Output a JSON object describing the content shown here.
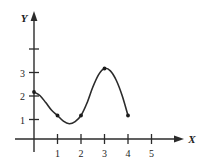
{
  "figure": {
    "background_color": "#ffffff",
    "ink_color": "#2b2b2b",
    "text_color": "#1c1c1c"
  },
  "axes": {
    "x_axis_label": "X",
    "y_axis_label": "Y",
    "x_tick_labels": [
      "1",
      "2",
      "3",
      "4",
      "5"
    ],
    "y_tick_labels": [
      "1",
      "2",
      "3"
    ]
  },
  "chart_data": {
    "type": "line",
    "title": "",
    "xlabel": "X",
    "ylabel": "Y",
    "xlim": [
      0,
      5.6
    ],
    "ylim": [
      0,
      4.4
    ],
    "grid": false,
    "legend": "none",
    "x_ticks": [
      1,
      2,
      3,
      4,
      5
    ],
    "y_ticks": [
      1,
      2,
      3,
      4
    ],
    "x_tick_labels": [
      "1",
      "2",
      "3",
      "4",
      "5"
    ],
    "y_tick_labels": [
      "1",
      "2",
      "3",
      ""
    ],
    "series": [
      {
        "name": "curve",
        "x": [
          0,
          0.25,
          0.5,
          0.75,
          1,
          1.25,
          1.5,
          1.75,
          2,
          2.25,
          2.5,
          2.75,
          3,
          3.25,
          3.5,
          3.75,
          4
        ],
        "values": [
          2,
          1.85,
          1.55,
          1.22,
          1,
          0.76,
          0.65,
          0.74,
          1,
          1.52,
          2.2,
          2.74,
          3,
          2.9,
          2.5,
          1.85,
          1
        ]
      }
    ],
    "marked_points": [
      {
        "x": 1,
        "y": 1
      },
      {
        "x": 2,
        "y": 1
      },
      {
        "x": 3,
        "y": 3
      },
      {
        "x": 4,
        "y": 1
      }
    ],
    "annotations": [
      {
        "text": "local minimum near x = 1.5, y ≈ 0.65"
      },
      {
        "text": "local maximum at x = 3, y = 3"
      },
      {
        "text": "curve starts at (0, 2) and ends at (4, 1)"
      }
    ]
  }
}
